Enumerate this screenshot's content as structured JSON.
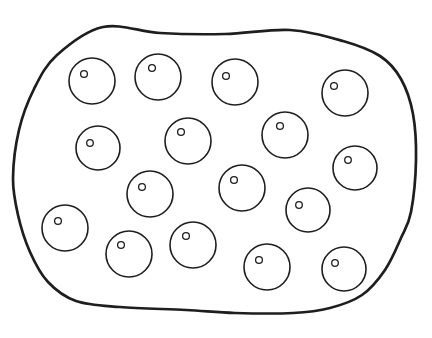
{
  "figure": {
    "canvas": {
      "width": 432,
      "height": 338
    },
    "background_color": "#ffffff",
    "stroke_color": "#1e1e1e",
    "outline": {
      "stroke_width": 2.7,
      "fill": "#ffffff",
      "points": [
        [
          103,
          27
        ],
        [
          160,
          33
        ],
        [
          225,
          34
        ],
        [
          290,
          30
        ],
        [
          343,
          41
        ],
        [
          380,
          56
        ],
        [
          401,
          79
        ],
        [
          413,
          114
        ],
        [
          416,
          160
        ],
        [
          411,
          212
        ],
        [
          401,
          238
        ],
        [
          385,
          270
        ],
        [
          362,
          295
        ],
        [
          330,
          308
        ],
        [
          293,
          313
        ],
        [
          235,
          313
        ],
        [
          186,
          310
        ],
        [
          120,
          307
        ],
        [
          76,
          301
        ],
        [
          48,
          282
        ],
        [
          30,
          252
        ],
        [
          18,
          215
        ],
        [
          13,
          178
        ],
        [
          19,
          130
        ],
        [
          34,
          89
        ],
        [
          57,
          55
        ]
      ]
    },
    "cells": {
      "stroke_width": 1.6,
      "dot_stroke_width": 1.3,
      "fill": "#ffffff",
      "count": 16,
      "items": [
        {
          "cx": 92,
          "cy": 81,
          "r": 23,
          "dot": {
            "cx": 84,
            "cy": 74,
            "r": 3.4
          }
        },
        {
          "cx": 158,
          "cy": 77,
          "r": 23,
          "dot": {
            "cx": 152,
            "cy": 68,
            "r": 3.4
          }
        },
        {
          "cx": 235,
          "cy": 82,
          "r": 23,
          "dot": {
            "cx": 226,
            "cy": 76,
            "r": 3.4
          }
        },
        {
          "cx": 345,
          "cy": 93,
          "r": 23,
          "dot": {
            "cx": 334,
            "cy": 86,
            "r": 3.4
          }
        },
        {
          "cx": 98,
          "cy": 148,
          "r": 22,
          "dot": {
            "cx": 90,
            "cy": 143,
            "r": 3.3
          }
        },
        {
          "cx": 188,
          "cy": 141,
          "r": 23,
          "dot": {
            "cx": 181,
            "cy": 132,
            "r": 3.4
          }
        },
        {
          "cx": 285,
          "cy": 135,
          "r": 23,
          "dot": {
            "cx": 280,
            "cy": 126,
            "r": 3.4
          }
        },
        {
          "cx": 150,
          "cy": 194,
          "r": 23,
          "dot": {
            "cx": 142,
            "cy": 187,
            "r": 3.4
          }
        },
        {
          "cx": 65,
          "cy": 228,
          "r": 23,
          "dot": {
            "cx": 58,
            "cy": 221,
            "r": 3.4
          }
        },
        {
          "cx": 242,
          "cy": 188,
          "r": 23,
          "dot": {
            "cx": 234,
            "cy": 180,
            "r": 3.4
          }
        },
        {
          "cx": 308,
          "cy": 210,
          "r": 22,
          "dot": {
            "cx": 299,
            "cy": 205,
            "r": 3.3
          }
        },
        {
          "cx": 355,
          "cy": 168,
          "r": 22,
          "dot": {
            "cx": 348,
            "cy": 160,
            "r": 3.3
          }
        },
        {
          "cx": 129,
          "cy": 254,
          "r": 23,
          "dot": {
            "cx": 121,
            "cy": 245,
            "r": 3.4
          }
        },
        {
          "cx": 193,
          "cy": 245,
          "r": 23,
          "dot": {
            "cx": 186,
            "cy": 236,
            "r": 3.4
          }
        },
        {
          "cx": 267,
          "cy": 267,
          "r": 23,
          "dot": {
            "cx": 259,
            "cy": 260,
            "r": 3.4
          }
        },
        {
          "cx": 344,
          "cy": 269,
          "r": 22,
          "dot": {
            "cx": 335,
            "cy": 263,
            "r": 3.3
          }
        }
      ]
    }
  }
}
